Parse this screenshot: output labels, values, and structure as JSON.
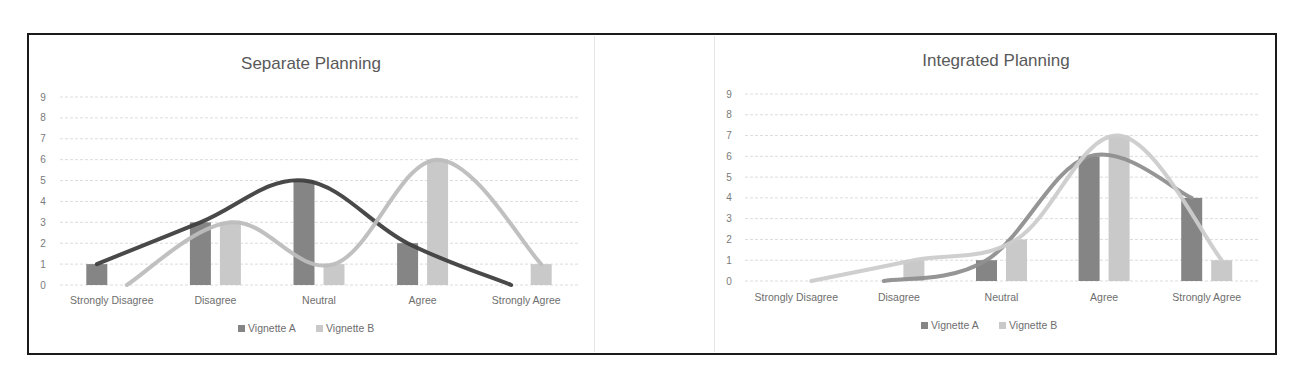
{
  "chart_data": [
    {
      "type": "bar",
      "title": "Separate Planning",
      "categories": [
        "Strongly Disagree",
        "Disagree",
        "Neutral",
        "Agree",
        "Strongly Agree"
      ],
      "series": [
        {
          "name": "Vignette A",
          "values": [
            1,
            3,
            5,
            2,
            0
          ],
          "bar_color": "#858585",
          "trend_color": "#3f3f3f"
        },
        {
          "name": "Vignette B",
          "values": [
            0,
            3,
            1,
            6,
            1
          ],
          "bar_color": "#c9c9c9",
          "trend_color": "#bdbdbd"
        }
      ],
      "overlay": "smoothed line per series",
      "xlabel": "",
      "ylabel": "",
      "ylim": [
        0,
        9
      ],
      "yticks": [
        0,
        1,
        2,
        3,
        4,
        5,
        6,
        7,
        8,
        9
      ],
      "grid": true,
      "legend_position": "bottom"
    },
    {
      "type": "bar",
      "title": "Integrated Planning",
      "categories": [
        "Strongly Disagree",
        "Disagree",
        "Neutral",
        "Agree",
        "Strongly Agree"
      ],
      "series": [
        {
          "name": "Vignette A",
          "values": [
            0,
            0,
            1,
            6,
            4
          ],
          "bar_color": "#858585",
          "trend_color": "#8f8f8f"
        },
        {
          "name": "Vignette B",
          "values": [
            0,
            1,
            2,
            7,
            1
          ],
          "bar_color": "#c9c9c9",
          "trend_color": "#cccccc"
        }
      ],
      "overlay": "smoothed line per series",
      "xlabel": "",
      "ylabel": "",
      "ylim": [
        0,
        9
      ],
      "yticks": [
        0,
        1,
        2,
        3,
        4,
        5,
        6,
        7,
        8,
        9
      ],
      "grid": true,
      "legend_position": "bottom"
    }
  ],
  "layout": {
    "charts": [
      {
        "x0": 60,
        "x1": 578,
        "y_top": 97,
        "y_zero": 285,
        "title_x": 311,
        "title_y": 69,
        "ytick_x": 43,
        "cat_y": 304,
        "legend_y": 332,
        "legend_x": 238,
        "line_start": [
          {
            "i": 0,
            "dx": -14
          },
          {
            "i": 0,
            "dx": 14
          }
        ]
      },
      {
        "x0": 745,
        "x1": 1258,
        "y_top": 94,
        "y_zero": 281,
        "title_x": 996,
        "title_y": 66,
        "ytick_x": 729,
        "cat_y": 301,
        "legend_x": 921,
        "legend_y": 329
      }
    ]
  }
}
